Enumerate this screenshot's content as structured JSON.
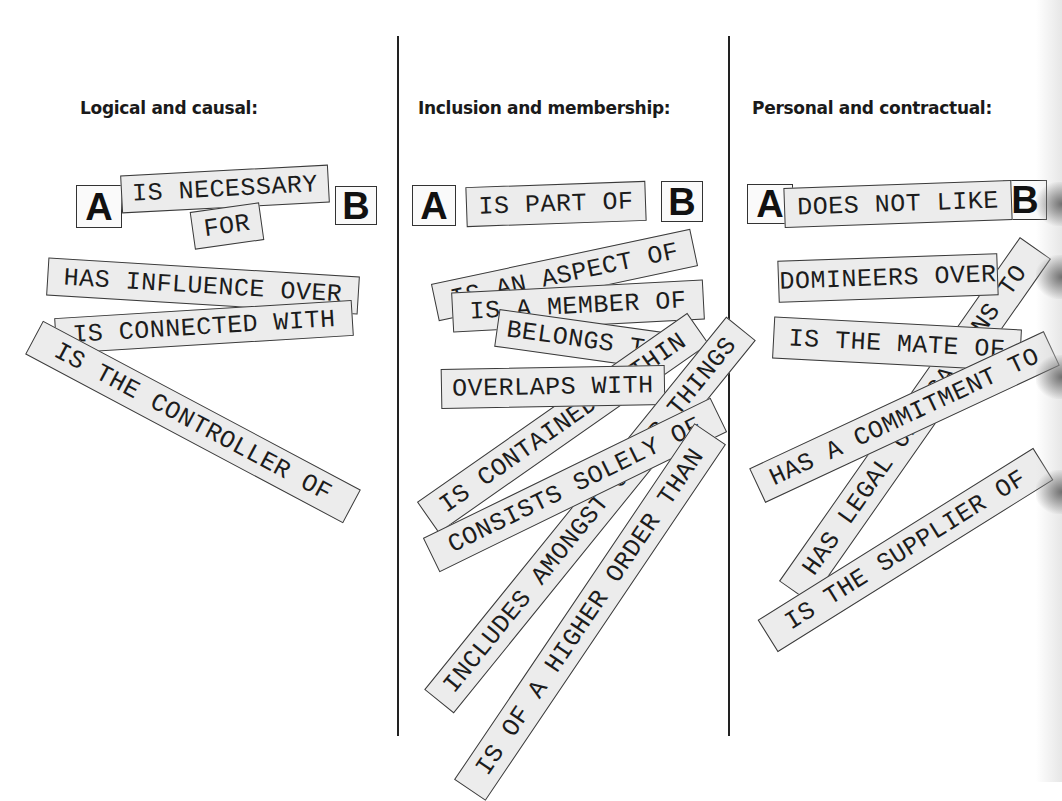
{
  "columns": [
    {
      "heading": "Logical and causal:",
      "template": {
        "subject": "A",
        "relation": "IS NECESSARY",
        "relation_cont": "FOR",
        "object": "B"
      },
      "strips": [
        "HAS INFLUENCE OVER",
        "IS CONNECTED WITH",
        "IS THE CONTROLLER OF"
      ]
    },
    {
      "heading": "Inclusion and membership:",
      "template": {
        "subject": "A",
        "relation": "IS PART OF",
        "object": "B"
      },
      "strips": [
        "IS AN ASPECT OF",
        "IS A MEMBER OF",
        "BELONGS TO",
        "OVERLAPS WITH",
        "IS CONTAINED WITHIN",
        "INCLUDES AMONGST OTHER THINGS",
        "CONSISTS SOLELY OF",
        "IS OF A HIGHER ORDER THAN"
      ]
    },
    {
      "heading": "Personal and contractual:",
      "template": {
        "subject": "A",
        "relation": "DOES NOT LIKE",
        "object": "B"
      },
      "strips": [
        "DOMINEERS OVER",
        "IS THE MATE OF",
        "HAS LEGAL OBLIGATIONS TO",
        "HAS A COMMITMENT TO",
        "IS THE SUPPLIER OF"
      ]
    }
  ],
  "colors": {
    "strip_fill": "#ececec",
    "strip_border": "#3a3a3a",
    "text": "#1c1c1c",
    "divider": "#222222"
  }
}
